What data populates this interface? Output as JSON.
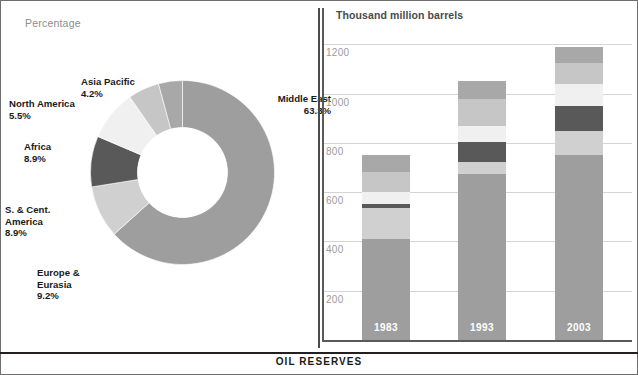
{
  "figure": {
    "caption": "OIL RESERVES",
    "left_panel_label": "Percentage",
    "right_panel_label": "Thousand million barrels"
  },
  "colors": {
    "middle_east": "#9e9e9e",
    "europe_eurasia": "#d0d0d0",
    "s_cent_america": "#595959",
    "africa": "#f0f0f0",
    "north_america": "#c6c6c6",
    "asia_pacific": "#a8a8a8",
    "gridline": "#d5d5d5",
    "axis": "#5a5a5a",
    "tick_text": "#9b9b9b",
    "label_text": "#1a1a1a",
    "panel_label_text": "#8d8d8d"
  },
  "chart_data": [
    {
      "type": "pie",
      "title": "Percentage",
      "subtitle": "Share of oil reserves by region",
      "donut": true,
      "labels": [
        "Middle East",
        "Europe & Eurasia",
        "S. & Cent. America",
        "Africa",
        "North America",
        "Asia Pacific"
      ],
      "values": [
        63.3,
        9.2,
        8.9,
        8.9,
        5.5,
        4.2
      ],
      "value_labels": [
        "63.3%",
        "9.2%",
        "8.9%",
        "8.9%",
        "5.5%",
        "4.2%"
      ],
      "label_lines": [
        [
          "Middle East",
          "63.3%"
        ],
        [
          "Europe &",
          "Eurasia",
          "9.2%"
        ],
        [
          "S. & Cent.",
          "America",
          "8.9%"
        ],
        [
          "Africa",
          "8.9%"
        ],
        [
          "North America",
          "5.5%"
        ],
        [
          "Asia Pacific",
          "4.2%"
        ]
      ],
      "units": "percent",
      "legend": "none",
      "grid": false
    },
    {
      "type": "bar",
      "stacked": true,
      "title": "Thousand million barrels",
      "ylabel": "Thousand million barrels",
      "xlabel": "",
      "categories": [
        "1983",
        "1993",
        "2003"
      ],
      "ylim": [
        0,
        1250
      ],
      "yticks": [
        200,
        400,
        600,
        800,
        1000,
        1200
      ],
      "ytick_labels": [
        "200",
        "400",
        "600",
        "800",
        "1000",
        "1200"
      ],
      "grid": true,
      "legend": "none",
      "series": [
        {
          "name": "Middle East",
          "values": [
            410,
            673,
            752
          ]
        },
        {
          "name": "Europe & Eurasia",
          "values": [
            125,
            50,
            98
          ]
        },
        {
          "name": "S. & Cent. America",
          "values": [
            18,
            82,
            100
          ]
        },
        {
          "name": "Africa",
          "values": [
            47,
            65,
            90
          ]
        },
        {
          "name": "North America",
          "values": [
            80,
            110,
            85
          ]
        },
        {
          "name": "Asia Pacific",
          "values": [
            72,
            70,
            65
          ]
        }
      ],
      "totals": [
        752,
        1050,
        1190
      ]
    }
  ]
}
